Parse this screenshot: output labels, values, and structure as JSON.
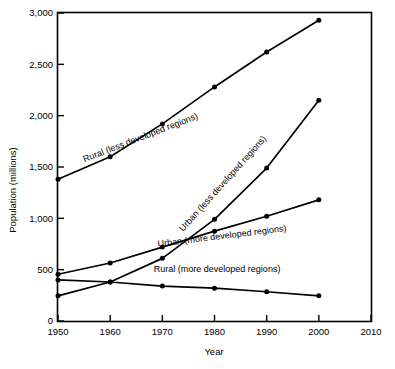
{
  "chart_data": {
    "type": "line",
    "title": "",
    "xlabel": "Year",
    "ylabel": "Population (millions)",
    "x": [
      1950,
      1960,
      1970,
      1980,
      1990,
      2000
    ],
    "xlim": [
      1950,
      2010
    ],
    "ylim": [
      0,
      3000
    ],
    "xticks": [
      "1950",
      "1960",
      "1970",
      "1980",
      "1990",
      "2000",
      "2010"
    ],
    "xtick_values": [
      1950,
      1960,
      1970,
      1980,
      1990,
      2000,
      2010
    ],
    "yticks": [
      "0",
      "500",
      "1,000",
      "1,500",
      "2,000",
      "2,500",
      "3,000"
    ],
    "ytick_values": [
      0,
      500,
      1000,
      1500,
      2000,
      2500,
      3000
    ],
    "grid": false,
    "legend_position": "inline-annotations",
    "marker": "filled-circle",
    "line_color": "#000000",
    "series": [
      {
        "name": "Rural (less developed regions)",
        "values": [
          1380,
          1600,
          1920,
          2280,
          2620,
          2930
        ],
        "label_anchor": {
          "x": 1966,
          "y": 1760
        },
        "label_rotation": -21
      },
      {
        "name": "Urban (less developed regions)",
        "values": [
          245,
          380,
          610,
          990,
          1490,
          2150
        ],
        "label_anchor": {
          "x": 1982,
          "y": 1320
        },
        "label_rotation": -48
      },
      {
        "name": "Urban (more developed regions)",
        "values": [
          455,
          565,
          720,
          875,
          1020,
          1180
        ],
        "label_anchor": {
          "x": 1981.5,
          "y": 800
        },
        "label_rotation": -7
      },
      {
        "name": "Rural (more developed regions)",
        "values": [
          400,
          380,
          340,
          320,
          285,
          245
        ],
        "label_anchor": {
          "x": 1980.5,
          "y": 480
        },
        "label_rotation": 0
      }
    ]
  },
  "axes": {
    "x_title": "Year",
    "y_title": "Population (millions)"
  }
}
